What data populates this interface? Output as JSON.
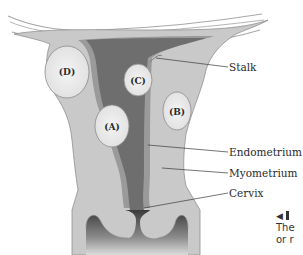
{
  "diagram": {
    "fibroids": [
      {
        "label": "(A)",
        "x": 112,
        "y": 126
      },
      {
        "label": "(B)",
        "x": 177,
        "y": 111
      },
      {
        "label": "(C)",
        "x": 67,
        "y": 72
      },
      {
        "label": "(D)",
        "x": 138,
        "y": 80
      }
    ],
    "callouts": [
      {
        "label": "Stalk",
        "x": 229,
        "y": 62
      },
      {
        "label": "Endometrium",
        "x": 229,
        "y": 147
      },
      {
        "label": "Myometrium",
        "x": 229,
        "y": 168
      },
      {
        "label": "Cervix",
        "x": 229,
        "y": 188
      }
    ],
    "caption": {
      "marker": "◀",
      "line1": "The",
      "line2": "or r"
    },
    "colors": {
      "myometrium": "#c9c9c9",
      "endometrium": "#9a9a9a",
      "cavity": "#6e6e6e",
      "fibroid": "#ececec",
      "outline": "#8a8a8a",
      "text": "#2a2a2a"
    }
  }
}
